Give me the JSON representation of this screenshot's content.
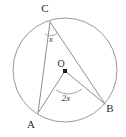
{
  "figure": {
    "type": "circle-geometry-diagram",
    "background_color": "#ffffff",
    "stroke_color": "#8d8d8d",
    "text_color": "#2b2b2b",
    "width": 126,
    "height": 137
  },
  "circle": {
    "center_x": 65,
    "center_y": 70,
    "radius": 52,
    "center_label": "O"
  },
  "points": [
    {
      "id": "C",
      "label": "C",
      "x": 50,
      "y": 22,
      "label_x": 45,
      "label_y": 12
    },
    {
      "id": "B",
      "label": "B",
      "x": 105,
      "y": 104,
      "label_x": 110,
      "label_y": 112
    },
    {
      "id": "A",
      "label": "A",
      "x": 38,
      "y": 113,
      "label_x": 31,
      "label_y": 128
    },
    {
      "id": "O",
      "label": "O",
      "x": 65,
      "y": 71,
      "label_x": 61,
      "label_y": 67
    }
  ],
  "segments": [
    {
      "id": "CA",
      "from": "C",
      "to": "A"
    },
    {
      "id": "CB",
      "from": "C",
      "to": "B"
    },
    {
      "id": "OA",
      "from": "O",
      "to": "A"
    },
    {
      "id": "OB",
      "from": "O",
      "to": "B"
    }
  ],
  "angles": [
    {
      "id": "inscribed-angle-ACB",
      "vertex": "C",
      "label": "x",
      "label_x": 51,
      "label_y": 42,
      "arc_d": "M 45 34 A 9 9 0 0 0 57 33"
    },
    {
      "id": "central-angle-AOB",
      "vertex": "O",
      "label": "2x",
      "label_x": 66,
      "label_y": 101,
      "arc_d": "M 56 90 A 21 21 0 0 0 82 89"
    }
  ]
}
